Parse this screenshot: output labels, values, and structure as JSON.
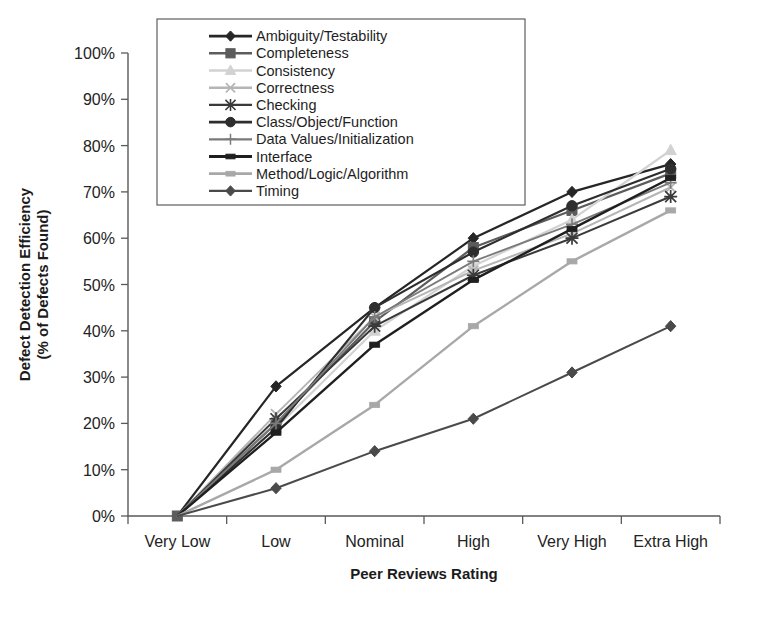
{
  "chart_data": {
    "type": "line",
    "title": "",
    "xlabel": "Peer Reviews Rating",
    "ylabel": "Defect Detection Efficiency\n(% of Defects Found)",
    "ylabel_line1": "Defect Detection Efficiency",
    "ylabel_line2": "(% of Defects Found)",
    "categories": [
      "Very Low",
      "Low",
      "Nominal",
      "High",
      "Very High",
      "Extra High"
    ],
    "ylim": [
      0,
      100
    ],
    "ytick_labels": [
      "0%",
      "10%",
      "20%",
      "30%",
      "40%",
      "50%",
      "60%",
      "70%",
      "80%",
      "90%",
      "100%"
    ],
    "ytick_values": [
      0,
      10,
      20,
      30,
      40,
      50,
      60,
      70,
      80,
      90,
      100
    ],
    "grid": false,
    "legend_position": "top-center-inside",
    "series": [
      {
        "name": "Ambiguity/Testability",
        "values": [
          0,
          28,
          45,
          60,
          70,
          76
        ],
        "color": "#262626",
        "marker": "diamond",
        "width": 2.2
      },
      {
        "name": "Completeness",
        "values": [
          0,
          20,
          42,
          58,
          66,
          74
        ],
        "color": "#5c5c5c",
        "marker": "square",
        "width": 2.2
      },
      {
        "name": "Consistency",
        "values": [
          0,
          19,
          40,
          54,
          64,
          79
        ],
        "color": "#d2d2d2",
        "marker": "triangle",
        "width": 2.2
      },
      {
        "name": "Correctness",
        "values": [
          0,
          22,
          43,
          53,
          61,
          71
        ],
        "color": "#b5b5b5",
        "marker": "x",
        "width": 2.0
      },
      {
        "name": "Checking",
        "values": [
          0,
          21,
          41,
          52,
          60,
          69
        ],
        "color": "#3a3a3a",
        "marker": "asterisk",
        "width": 2.0
      },
      {
        "name": "Class/Object/Function",
        "values": [
          0,
          19,
          45,
          57,
          67,
          75
        ],
        "color": "#2e2e2e",
        "marker": "circle",
        "width": 2.2
      },
      {
        "name": "Data Values/Initialization",
        "values": [
          0,
          20,
          43,
          55,
          63,
          72
        ],
        "color": "#7a7a7a",
        "marker": "plus",
        "width": 1.8
      },
      {
        "name": "Interface",
        "values": [
          0,
          18,
          37,
          51,
          62,
          73
        ],
        "color": "#1f1f1f",
        "marker": "bar",
        "width": 2.4
      },
      {
        "name": "Method/Logic/Algorithm",
        "values": [
          0,
          10,
          24,
          41,
          55,
          66
        ],
        "color": "#a8a8a8",
        "marker": "bar",
        "width": 2.4
      },
      {
        "name": "Timing",
        "values": [
          0,
          6,
          14,
          21,
          31,
          41
        ],
        "color": "#4a4a4a",
        "marker": "diamond",
        "width": 2.0
      }
    ]
  }
}
